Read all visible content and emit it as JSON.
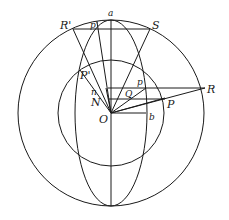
{
  "diagram": {
    "labels": {
      "a": "a",
      "R_prime": "R'",
      "p_prime": "p'",
      "S": "S",
      "P_prime": "P'",
      "p": "p",
      "R": "R",
      "n": "n",
      "Q": "Q",
      "N": "N",
      "P": "P",
      "O": "O",
      "b": "b"
    }
  }
}
